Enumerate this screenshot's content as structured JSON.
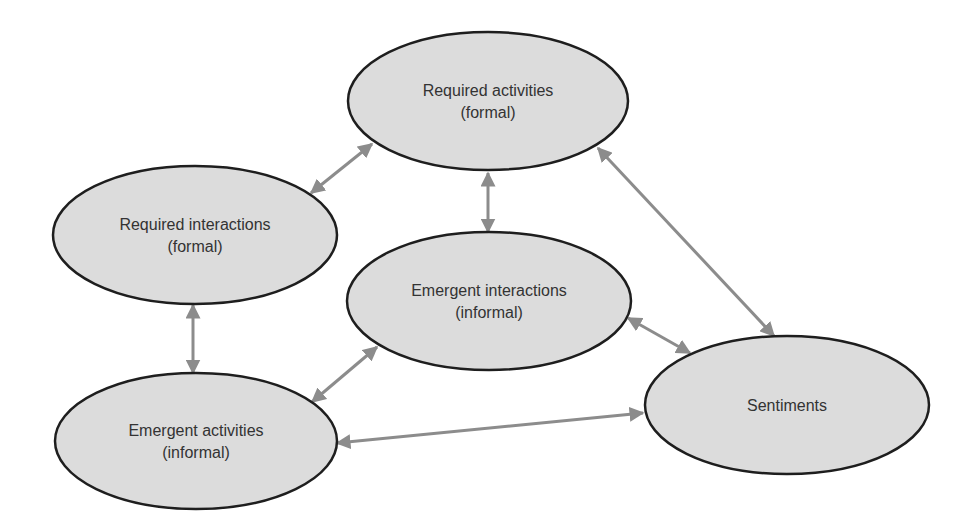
{
  "diagram": {
    "type": "flow-diagram",
    "background": "#ffffff",
    "node_fill": "#dcdcdc",
    "node_stroke": "#1e1e1e",
    "arrow_color": "#8c8c8c",
    "text_color": "#333333",
    "nodes": [
      {
        "id": "required-activities",
        "line1": "Required activities",
        "line2": "(formal)",
        "cx": 488,
        "cy": 101,
        "rx": 140,
        "ry": 69
      },
      {
        "id": "required-interactions",
        "line1": "Required interactions",
        "line2": "(formal)",
        "cx": 195,
        "cy": 235,
        "rx": 142,
        "ry": 69
      },
      {
        "id": "emergent-interactions",
        "line1": "Emergent interactions",
        "line2": "(informal)",
        "cx": 489,
        "cy": 301,
        "rx": 142,
        "ry": 69
      },
      {
        "id": "emergent-activities",
        "line1": "Emergent activities",
        "line2": "(informal)",
        "cx": 196,
        "cy": 441,
        "rx": 141,
        "ry": 68
      },
      {
        "id": "sentiments",
        "line1": "Sentiments",
        "line2": "",
        "cx": 787,
        "cy": 405,
        "rx": 142,
        "ry": 69
      }
    ],
    "edges": [
      {
        "from": "required-interactions",
        "to": "required-activities",
        "x1": 311,
        "y1": 193,
        "x2": 372,
        "y2": 144,
        "bidirectional": true
      },
      {
        "from": "required-activities",
        "to": "emergent-interactions",
        "x1": 488,
        "y1": 173,
        "x2": 488,
        "y2": 232,
        "bidirectional": true
      },
      {
        "from": "required-activities",
        "to": "sentiments",
        "x1": 598,
        "y1": 148,
        "x2": 774,
        "y2": 336,
        "bidirectional": true
      },
      {
        "from": "required-interactions",
        "to": "emergent-activities",
        "x1": 193,
        "y1": 305,
        "x2": 193,
        "y2": 373,
        "bidirectional": true
      },
      {
        "from": "emergent-activities",
        "to": "emergent-interactions",
        "x1": 312,
        "y1": 402,
        "x2": 377,
        "y2": 347,
        "bidirectional": true
      },
      {
        "from": "emergent-interactions",
        "to": "sentiments",
        "x1": 628,
        "y1": 318,
        "x2": 690,
        "y2": 353,
        "bidirectional": true
      },
      {
        "from": "emergent-activities",
        "to": "sentiments",
        "x1": 337,
        "y1": 443,
        "x2": 643,
        "y2": 413,
        "bidirectional": true
      }
    ]
  }
}
